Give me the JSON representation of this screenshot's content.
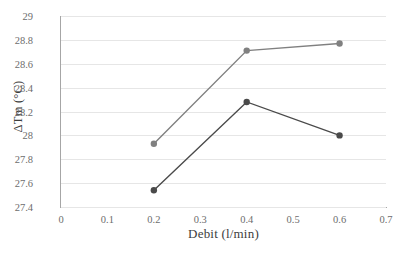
{
  "chart_data": {
    "type": "line",
    "title": "",
    "subtitle": "",
    "xlabel": "Debit (l/min)",
    "ylabel": "ΔTm (°C)",
    "x": [
      0.2,
      0.4,
      0.6
    ],
    "xlim": [
      0,
      0.7
    ],
    "ylim": [
      27.4,
      29
    ],
    "xticks": [
      "0",
      "0.1",
      "0.2",
      "0.3",
      "0.4",
      "0.5",
      "0.6",
      "0.7"
    ],
    "xtick_values": [
      0,
      0.1,
      0.2,
      0.3,
      0.4,
      0.5,
      0.6,
      0.7
    ],
    "yticks": [
      "27.4",
      "27.6",
      "27.8",
      "28",
      "28.2",
      "28.4",
      "28.6",
      "28.8",
      "29"
    ],
    "ytick_values": [
      27.4,
      27.6,
      27.8,
      28,
      28.2,
      28.4,
      28.6,
      28.8,
      29
    ],
    "grid": "horizontal",
    "legend": "none",
    "series": [
      {
        "name": "series-light",
        "color": "#808080",
        "marker": "circle",
        "values": [
          27.93,
          28.71,
          28.77
        ]
      },
      {
        "name": "series-dark",
        "color": "#4a4a4a",
        "marker": "circle",
        "values": [
          27.54,
          28.28,
          28.0
        ]
      }
    ]
  },
  "colors": {
    "axis": "#a6a6a6",
    "grid": "#e6e6e6",
    "tick_text": "#6d6d6d",
    "axis_title": "#3d3d3d",
    "background": "#ffffff"
  }
}
